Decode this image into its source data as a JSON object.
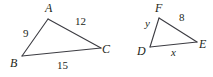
{
  "figure": {
    "type": "geometry-diagram",
    "stroke_color": "#3c3c42",
    "text_color": "#231f20",
    "background": "#ffffff",
    "width": 213,
    "height": 77
  },
  "triangles": [
    {
      "name": "triangle-abc",
      "vertices": [
        {
          "label": "A",
          "x": 48,
          "y": 19,
          "label_x": 45,
          "label_y": 2
        },
        {
          "label": "B",
          "x": 22,
          "y": 56,
          "label_x": 10,
          "label_y": 57
        },
        {
          "label": "C",
          "x": 101,
          "y": 48,
          "label_x": 102,
          "label_y": 43
        }
      ],
      "sides": [
        {
          "name": "side-ab",
          "label": "9",
          "label_x": 23,
          "label_y": 28
        },
        {
          "name": "side-ac",
          "label": "12",
          "label_x": 75,
          "label_y": 16
        },
        {
          "name": "side-bc",
          "label": "15",
          "label_x": 57,
          "label_y": 60
        }
      ]
    },
    {
      "name": "triangle-def",
      "vertices": [
        {
          "label": "F",
          "x": 159,
          "y": 18,
          "label_x": 155,
          "label_y": 2
        },
        {
          "label": "D",
          "x": 150,
          "y": 47,
          "label_x": 137,
          "label_y": 45
        },
        {
          "label": "E",
          "x": 197,
          "y": 42,
          "label_x": 199,
          "label_y": 38
        }
      ],
      "sides": [
        {
          "name": "side-df",
          "label": "y",
          "label_x": 145,
          "label_y": 18
        },
        {
          "name": "side-fe",
          "label": "8",
          "label_x": 179,
          "label_y": 12
        },
        {
          "name": "side-de",
          "label": "x",
          "label_x": 171,
          "label_y": 47
        }
      ]
    }
  ]
}
